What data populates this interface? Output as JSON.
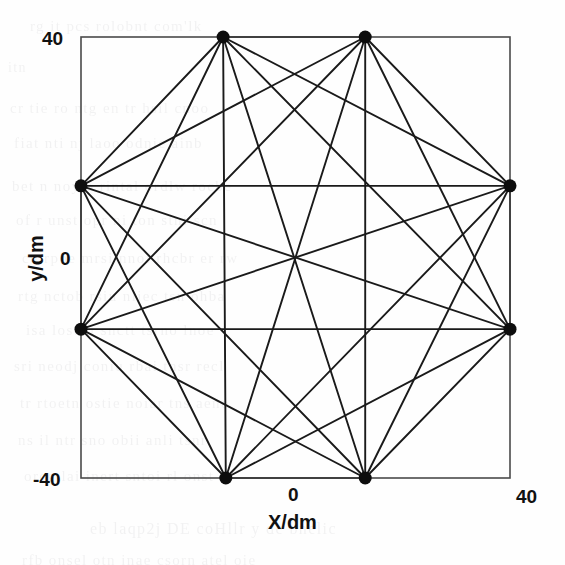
{
  "figure": {
    "background_color": "#fefefe",
    "frame_color": "#4a4a4a",
    "edge_color": "#1a1a1a",
    "node_color": "#0d0d0d",
    "text_color": "#111111"
  },
  "axes": {
    "x_title": "X/dm",
    "y_title": "y/dm",
    "x_ticks": [
      {
        "label": "0",
        "value": 0
      },
      {
        "label": "40",
        "value": 40
      }
    ],
    "y_ticks": [
      {
        "label": "40",
        "value": 40
      },
      {
        "label": "0",
        "value": 0
      },
      {
        "label": "-40",
        "value": -40
      }
    ]
  },
  "ghost_text": {
    "lines": [
      {
        "text": "rg it  pcs   rolobnt  com'lk",
        "x": 30,
        "y": 18,
        "size": 15
      },
      {
        "text": "itn",
        "x": 8,
        "y": 60,
        "size": 14
      },
      {
        "text": "cr  tie   ro  ntg  en tr  hsil  cnoo",
        "x": 10,
        "y": 100,
        "size": 15
      },
      {
        "text": "fiat  nti   nj   laoo   odnie  ainb",
        "x": 14,
        "y": 135,
        "size": 15
      },
      {
        "text": "bet n  noy   o  rintal  ordlw  rocbe",
        "x": 12,
        "y": 178,
        "size": 15
      },
      {
        "text": "of  r    unst   opr  ni  ton  stni  scn",
        "x": 16,
        "y": 212,
        "size": 15
      },
      {
        "text": "cu  rpoe   mrsi  nnoi  rhcbr  er  rw",
        "x": 22,
        "y": 250,
        "size": 15
      },
      {
        "text": "rtg  nctob   rsiu   nliec  tsn  ohba",
        "x": 18,
        "y": 288,
        "size": 15
      },
      {
        "text": "isa  lost    ii   snctt  tsrno  lnoe",
        "x": 26,
        "y": 322,
        "size": 15
      },
      {
        "text": "sri  neodj   coniu   rbai  tnsr  recl",
        "x": 14,
        "y": 358,
        "size": 15
      },
      {
        "text": "tr  rtoetn   ostie   noiar   tns  aeno",
        "x": 20,
        "y": 395,
        "size": 15
      },
      {
        "text": "ns  il    ntr  sno  obii   anli  tsnr",
        "x": 18,
        "y": 432,
        "size": 15
      },
      {
        "text": "orcg  lai   inert   sntoi  rl  onst",
        "x": 24,
        "y": 468,
        "size": 15
      },
      {
        "text": "eb   laqp2j   DE    coHllr    y  de   bnelic",
        "x": 90,
        "y": 520,
        "size": 16
      },
      {
        "text": "rfb  onsel   otn  inae  csorn  atel  oie",
        "x": 22,
        "y": 552,
        "size": 15
      }
    ]
  },
  "chart_data": {
    "type": "scatter",
    "title": "",
    "xlabel": "X/dm",
    "ylabel": "y/dm",
    "xlim": [
      -40,
      40
    ],
    "ylim": [
      -40,
      40
    ],
    "grid": false,
    "legend": "none",
    "node_labels": [
      "N1",
      "N2",
      "N3",
      "N4",
      "N5",
      "N6",
      "N7",
      "N8"
    ],
    "x": [
      -13.5,
      13.0,
      40.0,
      40.0,
      13.0,
      -13.0,
      -40.0,
      -40.0
    ],
    "y": [
      40.0,
      40.0,
      13.0,
      -13.0,
      -40.0,
      -40.0,
      -13.0,
      13.0
    ],
    "node_marker_size": 9,
    "edges": [
      [
        0,
        1
      ],
      [
        0,
        2
      ],
      [
        0,
        3
      ],
      [
        0,
        4
      ],
      [
        0,
        5
      ],
      [
        0,
        6
      ],
      [
        0,
        7
      ],
      [
        1,
        2
      ],
      [
        1,
        3
      ],
      [
        1,
        4
      ],
      [
        1,
        5
      ],
      [
        1,
        6
      ],
      [
        1,
        7
      ],
      [
        2,
        3
      ],
      [
        2,
        4
      ],
      [
        2,
        5
      ],
      [
        2,
        6
      ],
      [
        2,
        7
      ],
      [
        3,
        4
      ],
      [
        3,
        5
      ],
      [
        3,
        6
      ],
      [
        3,
        7
      ],
      [
        4,
        5
      ],
      [
        4,
        6
      ],
      [
        4,
        7
      ],
      [
        5,
        6
      ],
      [
        5,
        7
      ],
      [
        6,
        7
      ]
    ]
  }
}
